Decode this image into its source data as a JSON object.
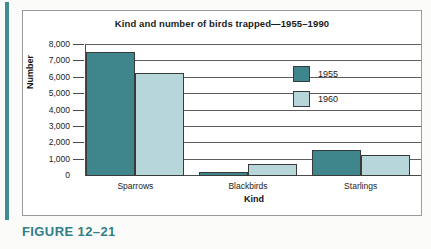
{
  "figure": {
    "caption": "FIGURE 12–21",
    "caption_color": "#2e7f87"
  },
  "chart_data": {
    "type": "bar",
    "title": "Kind and number of birds trapped—1955–1990",
    "xlabel": "Kind",
    "ylabel": "Number",
    "categories": [
      "Sparrows",
      "Blackbirds",
      "Starlings"
    ],
    "series": [
      {
        "name": "1955",
        "color": "#3e858c",
        "values": [
          7600,
          250,
          1600
        ]
      },
      {
        "name": "1960",
        "color": "#b7d6da",
        "values": [
          6300,
          750,
          1300
        ]
      }
    ],
    "ylim": [
      0,
      8000
    ],
    "yticks": [
      0,
      1000,
      2000,
      3000,
      4000,
      5000,
      6000,
      7000,
      8000
    ],
    "ytick_labels": [
      "0",
      "1,000",
      "2,000",
      "3,000",
      "4,000",
      "5,000",
      "6,000",
      "7,000",
      "8,000"
    ],
    "grid": true,
    "legend_position": "inside-right"
  }
}
